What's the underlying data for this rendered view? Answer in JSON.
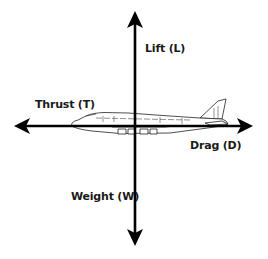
{
  "diagram": {
    "forces": {
      "lift": {
        "label": "Lift (L)",
        "direction": "up"
      },
      "thrust": {
        "label": "Thrust (T)",
        "direction": "left"
      },
      "drag": {
        "label": "Drag (D)",
        "direction": "right"
      },
      "weight": {
        "label": "Weight (W)",
        "direction": "down"
      }
    },
    "colors": {
      "background": "#ffffff",
      "arrow": "#000000",
      "text": "#1a1a1a",
      "aircraft_outline": "#222222"
    }
  }
}
